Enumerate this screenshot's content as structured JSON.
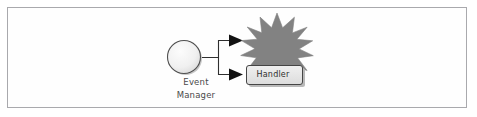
{
  "diagram": {
    "frame": {
      "border_color": "#a9a9ad",
      "background": "#fefefe"
    },
    "nodes": [
      {
        "id": "event-manager",
        "shape": "circle",
        "label_lines": [
          "Event",
          "Manager"
        ],
        "label_line_1": "Event",
        "label_line_2": "Manager",
        "fill": "#f2f2f2",
        "stroke": "#5c5c5c"
      },
      {
        "id": "event-burst",
        "shape": "starburst",
        "label": "",
        "points": 12,
        "fill": "#808080",
        "stroke": "#808080"
      },
      {
        "id": "handler",
        "shape": "rounded-rect",
        "label": "Handler",
        "fill": "#e8e8e8",
        "stroke": "#4a4a4a",
        "shadow": "#b4b4b4"
      }
    ],
    "connectors": [
      {
        "id": "to-burst",
        "from": "event-manager",
        "to": "event-burst",
        "arrowhead": "solid-triangle",
        "stroke": "#2a2a2a"
      },
      {
        "id": "to-handler",
        "from": "event-manager",
        "to": "handler",
        "arrowhead": "solid-triangle",
        "stroke": "#2a2a2a"
      }
    ]
  }
}
